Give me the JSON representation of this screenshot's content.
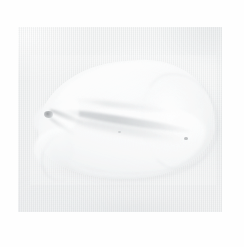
{
  "image": {
    "domain": "natural-image",
    "subject": "pale organic specimen",
    "description": "Extremely faded, low-contrast photograph of a pale cream-white organic object resembling a seed pod, shell or curled leaf, lying on a light neutral textured surface",
    "orientation": "horizontal, long axis running left to right, pointed tip at the left",
    "canvas": {
      "width_px": 244,
      "height_px": 247,
      "background_color": "#ffffff"
    },
    "panel": {
      "label": "photo-panel",
      "left_px": 18,
      "top_px": 27,
      "width_px": 204,
      "height_px": 185,
      "background_color": "#f2f3f3",
      "texture": "fine vertical weave / scan lines",
      "border": "none, soft edge against white mat"
    },
    "mat": {
      "label": "white border margin",
      "color": "#fefefe"
    },
    "subject_region": {
      "left_px": 30,
      "top_px": 55,
      "width_px": 186,
      "height_px": 130
    },
    "features": [
      {
        "name": "pointed-apex",
        "description": "narrow pointed tip at left end of the object",
        "approx_center_px": [
          40,
          95
        ]
      },
      {
        "name": "dark-apex-marking",
        "description": "small darkest spot at the apex, the highest-contrast point in the frame",
        "approx_center_px": [
          35,
          91
        ],
        "color": "#4e5458"
      },
      {
        "name": "apex-streaks",
        "description": "two fine dark streaks radiating down-right from the apex",
        "approx_center_px": [
          48,
          100
        ]
      },
      {
        "name": "central-seam",
        "description": "long diagonal suture or seam running from upper-left to lower-right across the body",
        "start_px": [
          58,
          115
        ],
        "end_px": [
          168,
          137
        ],
        "color": "#8a9196"
      },
      {
        "name": "secondary-seam",
        "description": "fainter parallel crease above the main seam",
        "start_px": [
          74,
          102
        ],
        "end_px": [
          160,
          118
        ]
      },
      {
        "name": "upper-lobe",
        "description": "broad rounded highlight lobe forming the top of the object",
        "approx_center_px": [
          128,
          92
        ]
      },
      {
        "name": "lower-lobe",
        "description": "shaded lower half of the object curving to the bottom arc",
        "approx_center_px": [
          124,
          146
        ]
      },
      {
        "name": "left-notch-fold",
        "description": "folded notch/crease on the lower-left flank below the apex",
        "approx_center_px": [
          48,
          130
        ]
      },
      {
        "name": "right-rounded-end",
        "description": "smooth rounded right end of the object",
        "approx_center_px": [
          186,
          122
        ]
      },
      {
        "name": "lower-contour-arc",
        "description": "gentle sweeping arc defining the bottom edge of the object",
        "approx_y_px": 180
      },
      {
        "name": "dark-speck-right",
        "description": "small isolated dark dot on the right flank",
        "approx_center_px": [
          196,
          138
        ],
        "color": "#606a6e"
      },
      {
        "name": "dark-speck-mid",
        "description": "tiny dark dot near the centre of the body",
        "approx_center_px": [
          130,
          132
        ]
      },
      {
        "name": "under-shadow",
        "description": "very diffuse soft shadow beneath the object",
        "approx_center_px": [
          135,
          188
        ]
      }
    ],
    "palette": {
      "canvas_white": "#ffffff",
      "mat_white": "#fefefe",
      "panel_light": "#f7f8f8",
      "panel_mid": "#f2f3f3",
      "panel_shade": "#eeeff0",
      "object_highlight": "#fafbfb",
      "object_mid": "#f4f5f5",
      "object_shade": "#e4e9eb",
      "seam_gray": "#8a9196",
      "darkest_point": "#4e5458"
    },
    "qualities": {
      "contrast": "very low",
      "exposure": "high key / overexposed",
      "focus": "soft",
      "grain": "fine"
    }
  }
}
